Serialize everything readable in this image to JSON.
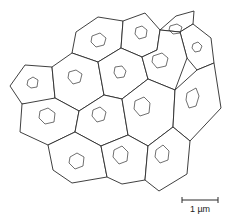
{
  "figure": {
    "type": "cell-network-diagram",
    "cell_count": 17,
    "colors": {
      "line": "#2a2a2a",
      "background": "#ffffff"
    }
  },
  "scale_bar": {
    "label": "1 µm"
  }
}
